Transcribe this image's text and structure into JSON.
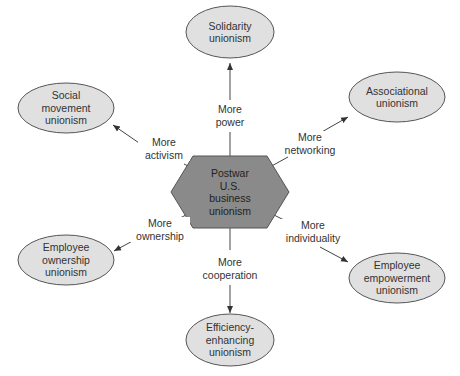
{
  "center": {
    "lines": [
      "Postwar",
      "U.S.",
      "business",
      "unionism"
    ],
    "fill": "#8a8a8a"
  },
  "nodes": [
    {
      "id": "solidarity",
      "lines": [
        "Solidarity",
        "unionism"
      ]
    },
    {
      "id": "associational",
      "lines": [
        "Associational",
        "unionism"
      ]
    },
    {
      "id": "empowerment",
      "lines": [
        "Employee",
        "empowerment",
        "unionism"
      ]
    },
    {
      "id": "efficiency",
      "lines": [
        "Efficiency-",
        "enhancing",
        "unionism"
      ]
    },
    {
      "id": "ownership",
      "lines": [
        "Employee",
        "ownership",
        "unionism"
      ]
    },
    {
      "id": "social",
      "lines": [
        "Social",
        "movement",
        "unionism"
      ]
    }
  ],
  "edges": [
    {
      "to": "solidarity",
      "lines": [
        "More",
        "power"
      ]
    },
    {
      "to": "associational",
      "lines": [
        "More",
        "networking"
      ]
    },
    {
      "to": "empowerment",
      "lines": [
        "More",
        "individuality"
      ]
    },
    {
      "to": "efficiency",
      "lines": [
        "More",
        "cooperation"
      ]
    },
    {
      "to": "ownership",
      "lines": [
        "More",
        "ownership"
      ]
    },
    {
      "to": "social",
      "lines": [
        "More",
        "activism"
      ]
    }
  ],
  "colors": {
    "ellipse_fill": "#e0e0e0",
    "stroke": "#555555",
    "hexagon": "#8a8a8a"
  }
}
